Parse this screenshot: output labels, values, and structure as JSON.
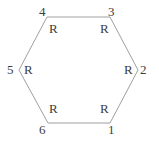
{
  "diagram": {
    "type": "hexagon-ring-structure",
    "shape": "hexagon",
    "stroke_color": "#a0a0a0",
    "text_color": "#3d3d3d",
    "background_color": "#ffffff",
    "stroke_width": 1,
    "vertices": [
      {
        "id": 4,
        "x": 47,
        "y": 17,
        "name": "top-left"
      },
      {
        "id": 3,
        "x": 110,
        "y": 17,
        "name": "top-right"
      },
      {
        "id": 2,
        "x": 138,
        "y": 70,
        "name": "right"
      },
      {
        "id": 1,
        "x": 110,
        "y": 123,
        "name": "bottom-right"
      },
      {
        "id": 6,
        "x": 48,
        "y": 123,
        "name": "bottom-left"
      },
      {
        "id": 5,
        "x": 19,
        "y": 70,
        "name": "left"
      }
    ],
    "polygon_points": "47,17 110,17 138,70 110,123 48,123 19,70",
    "substituents": [
      {
        "position": 4,
        "label": "R"
      },
      {
        "position": 3,
        "label": "R"
      },
      {
        "position": 2,
        "label": "R"
      },
      {
        "position": 1,
        "label": "R"
      },
      {
        "position": 6,
        "label": "R"
      },
      {
        "position": 5,
        "label": "R"
      }
    ],
    "position_numbers": [
      {
        "position": 4,
        "label": "4"
      },
      {
        "position": 3,
        "label": "3"
      },
      {
        "position": 2,
        "label": "2"
      },
      {
        "position": 1,
        "label": "1"
      },
      {
        "position": 6,
        "label": "6"
      },
      {
        "position": 5,
        "label": "5"
      }
    ]
  }
}
